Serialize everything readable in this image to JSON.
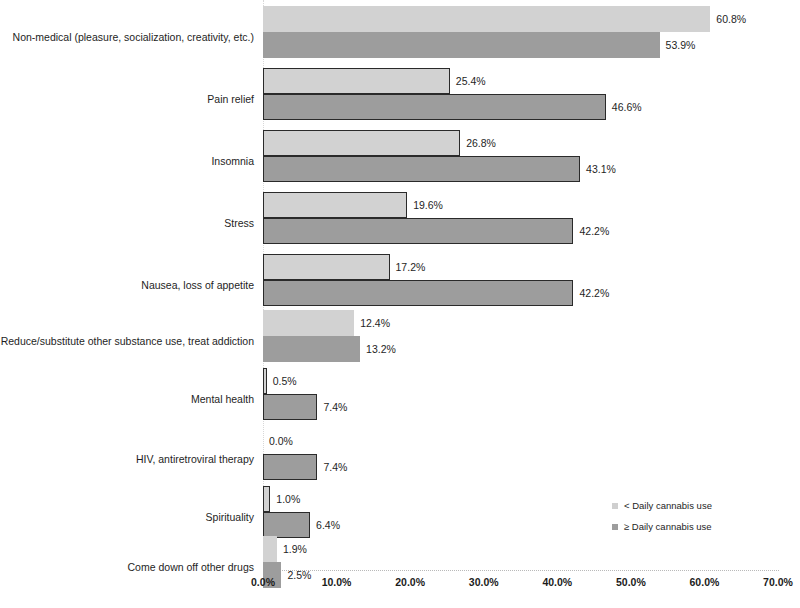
{
  "chart_data": {
    "type": "bar",
    "orientation": "horizontal",
    "title": "",
    "xlabel": "",
    "ylabel": "",
    "xlim": [
      0,
      70
    ],
    "xticks": [
      "0.0%",
      "10.0%",
      "20.0%",
      "30.0%",
      "40.0%",
      "50.0%",
      "60.0%",
      "70.0%"
    ],
    "xtick_values": [
      0,
      10,
      20,
      30,
      40,
      50,
      60,
      70
    ],
    "grid": false,
    "legend_position": "bottom-right",
    "categories": [
      "Non-medical (pleasure, socialization, creativity, etc.)",
      "Pain relief",
      "Insomnia",
      "Stress",
      "Nausea, loss of appetite",
      "Reduce/substitute other substance use, treat addiction",
      "Mental health",
      "HIV, antiretroviral therapy",
      "Spirituality",
      "Come down off other drugs"
    ],
    "series": [
      {
        "name": "< Daily cannabis use",
        "color": "#d2d2d2",
        "values": [
          60.8,
          25.4,
          26.8,
          19.6,
          17.2,
          12.4,
          0.5,
          0.0,
          1.0,
          1.9
        ],
        "labels": [
          "60.8%",
          "25.4%",
          "26.8%",
          "19.6%",
          "17.2%",
          "12.4%",
          "0.5%",
          "0.0%",
          "1.0%",
          "1.9%"
        ]
      },
      {
        "name": "≥ Daily cannabis use",
        "color": "#9d9d9d",
        "values": [
          53.9,
          46.6,
          43.1,
          42.2,
          42.2,
          13.2,
          7.4,
          7.4,
          6.4,
          2.5
        ],
        "labels": [
          "53.9%",
          "46.6%",
          "43.1%",
          "42.2%",
          "42.2%",
          "13.2%",
          "7.4%",
          "7.4%",
          "6.4%",
          "2.5%"
        ]
      }
    ]
  },
  "legend": {
    "items": [
      {
        "label": "< Daily cannabis use",
        "swatch": "light"
      },
      {
        "label": "≥ Daily cannabis use",
        "swatch": "dark"
      }
    ]
  }
}
